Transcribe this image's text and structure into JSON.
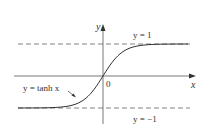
{
  "chart_data": {
    "type": "line",
    "title": "",
    "function_label": "y = tanh x",
    "xlabel": "x",
    "ylabel": "y",
    "origin_label": "0",
    "asymptotes": [
      {
        "label": "y = 1",
        "value": 1
      },
      {
        "label": "y = −1",
        "value": -1
      }
    ],
    "series": [
      {
        "name": "y = tanh x",
        "x": [
          -3,
          -2.5,
          -2,
          -1.5,
          -1,
          -0.5,
          0,
          0.5,
          1,
          1.5,
          2,
          2.5,
          3
        ],
        "values": [
          -0.995,
          -0.987,
          -0.964,
          -0.905,
          -0.762,
          -0.462,
          0,
          0.462,
          0.762,
          0.905,
          0.964,
          0.987,
          0.995
        ]
      }
    ],
    "ylim": [
      -1.4,
      1.6
    ],
    "grid": false,
    "colors": {
      "curve": "#333333",
      "axes": "#555555",
      "asymptote": "#666666"
    }
  }
}
